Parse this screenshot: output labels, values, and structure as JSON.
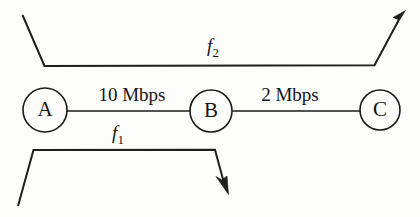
{
  "diagram": {
    "ink_color": "#1a1a1a",
    "background_color": "#fdfdfb",
    "nodes": [
      {
        "id": "A",
        "label": "A",
        "cx": 45,
        "cy": 110,
        "r": 22
      },
      {
        "id": "B",
        "label": "B",
        "cx": 211,
        "cy": 111,
        "r": 21
      },
      {
        "id": "C",
        "label": "C",
        "cx": 380,
        "cy": 110,
        "r": 20
      }
    ],
    "links": [
      {
        "id": "link-a-b",
        "from": "A",
        "to": "B",
        "capacity_label": "10 Mbps",
        "capacity_value": 10,
        "capacity_unit": "Mbps"
      },
      {
        "id": "link-b-c",
        "from": "B",
        "to": "C",
        "capacity_label": "2 Mbps",
        "capacity_value": 2,
        "capacity_unit": "Mbps"
      }
    ],
    "flows": [
      {
        "id": "flow-f2",
        "label": "f",
        "subscript": "2",
        "full_label": "f2",
        "position": "above",
        "direction": "left-to-right",
        "spans": "A to C"
      },
      {
        "id": "flow-f1",
        "label": "f",
        "subscript": "1",
        "full_label": "f1",
        "position": "below",
        "direction": "left-to-right",
        "spans": "A to B"
      }
    ]
  }
}
